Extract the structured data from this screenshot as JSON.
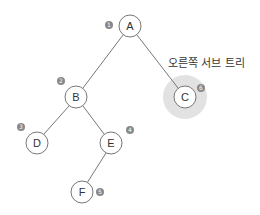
{
  "diagram": {
    "type": "binary-tree",
    "caption": "오른쪽 서브 트리",
    "nodes": [
      {
        "id": "A",
        "label": "A",
        "order": "1",
        "x": 130,
        "y": 26
      },
      {
        "id": "B",
        "label": "B",
        "order": "2",
        "x": 76,
        "y": 97
      },
      {
        "id": "D",
        "label": "D",
        "order": "3",
        "x": 37,
        "y": 143
      },
      {
        "id": "E",
        "label": "E",
        "order": "4",
        "x": 111,
        "y": 143
      },
      {
        "id": "F",
        "label": "F",
        "order": "5",
        "x": 82,
        "y": 192
      },
      {
        "id": "C",
        "label": "C",
        "order": "6",
        "x": 185,
        "y": 97
      }
    ],
    "edges": [
      [
        "A",
        "B"
      ],
      [
        "A",
        "C"
      ],
      [
        "B",
        "D"
      ],
      [
        "B",
        "E"
      ],
      [
        "E",
        "F"
      ]
    ],
    "highlighted": "C",
    "colors": {
      "edge": "#777777",
      "node_stroke": "#777777",
      "highlight": "#e2e2e2",
      "marker": "#888888"
    }
  }
}
